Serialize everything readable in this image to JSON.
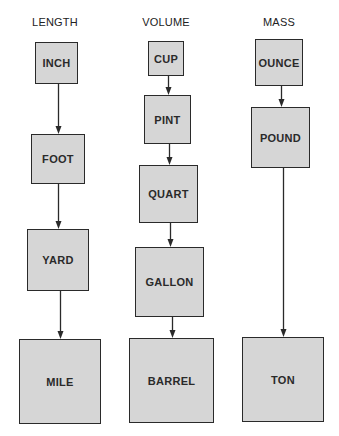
{
  "diagram": {
    "columns": [
      {
        "title": "LENGTH",
        "title_pos": {
          "x": 55,
          "y": 16
        },
        "units": [
          {
            "label": "INCH",
            "x": 35,
            "y": 42,
            "w": 43,
            "h": 42
          },
          {
            "label": "FOOT",
            "x": 31,
            "y": 134,
            "w": 54,
            "h": 50
          },
          {
            "label": "YARD",
            "x": 27,
            "y": 229,
            "w": 62,
            "h": 62
          },
          {
            "label": "MILE",
            "x": 19,
            "y": 339,
            "w": 82,
            "h": 85
          }
        ]
      },
      {
        "title": "VOLUME",
        "title_pos": {
          "x": 166,
          "y": 16
        },
        "units": [
          {
            "label": "CUP",
            "x": 148,
            "y": 41,
            "w": 36,
            "h": 35
          },
          {
            "label": "PINT",
            "x": 144,
            "y": 95,
            "w": 47,
            "h": 49
          },
          {
            "label": "QUART",
            "x": 139,
            "y": 165,
            "w": 59,
            "h": 58
          },
          {
            "label": "GALLON",
            "x": 135,
            "y": 247,
            "w": 69,
            "h": 70
          },
          {
            "label": "BARREL",
            "x": 129,
            "y": 338,
            "w": 85,
            "h": 85
          }
        ]
      },
      {
        "title": "MASS",
        "title_pos": {
          "x": 279,
          "y": 16
        },
        "units": [
          {
            "label": "OUNCE",
            "x": 255,
            "y": 39,
            "w": 48,
            "h": 47
          },
          {
            "label": "POUND",
            "x": 251,
            "y": 107,
            "w": 59,
            "h": 61
          },
          {
            "label": "TON",
            "x": 242,
            "y": 337,
            "w": 82,
            "h": 85
          }
        ]
      }
    ],
    "colors": {
      "box_fill": "#d6d6d6",
      "box_stroke": "#2a2a2a",
      "arrow": "#2a2a2a",
      "text": "#222222"
    }
  }
}
